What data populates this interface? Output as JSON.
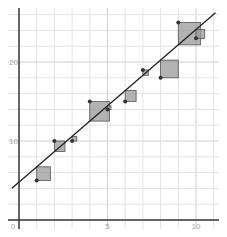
{
  "chart_data": {
    "type": "scatter",
    "title": "",
    "xlabel": "",
    "ylabel": "",
    "xlim": [
      -0.5,
      11.5
    ],
    "ylim": [
      -0.5,
      27.5
    ],
    "grid": true,
    "x_grid_step": 1,
    "y_grid_step": 2,
    "x_ticks": [
      {
        "value": 0,
        "label": "0"
      },
      {
        "value": 5,
        "label": "5"
      },
      {
        "value": 10,
        "label": "10"
      }
    ],
    "y_ticks": [
      {
        "value": 10,
        "label": "10"
      },
      {
        "value": 20,
        "label": "20"
      }
    ],
    "points": [
      {
        "x": 1,
        "y": 5
      },
      {
        "x": 2,
        "y": 10
      },
      {
        "x": 3,
        "y": 10
      },
      {
        "x": 4,
        "y": 15
      },
      {
        "x": 5,
        "y": 14
      },
      {
        "x": 6,
        "y": 15
      },
      {
        "x": 7,
        "y": 19
      },
      {
        "x": 8,
        "y": 18
      },
      {
        "x": 9,
        "y": 25
      },
      {
        "x": 10,
        "y": 23
      }
    ],
    "regression_line": {
      "slope": 1.93,
      "intercept": 4.8,
      "x_range": [
        -0.4,
        11.1
      ]
    },
    "show_residual_squares": true,
    "colors": {
      "grid": "#e4e4e4",
      "axis": "#333333",
      "point": "#333333",
      "line": "#222222",
      "square_fill": "#999999",
      "square_stroke": "#555555"
    }
  }
}
